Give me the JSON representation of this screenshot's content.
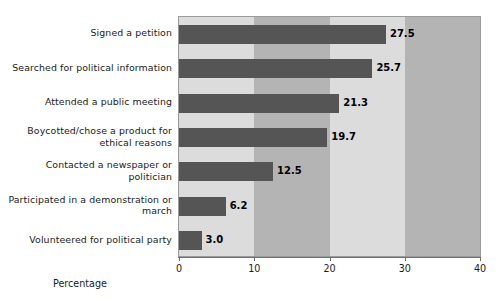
{
  "chart_data": {
    "type": "bar",
    "orientation": "horizontal",
    "title": "",
    "xlabel": "Percentage",
    "ylabel": "",
    "xlim": [
      0,
      40
    ],
    "xticks": [
      0,
      10,
      20,
      30,
      40
    ],
    "xtick_labels": [
      "0",
      "10",
      "20",
      "30",
      "40"
    ],
    "grid": false,
    "legend": null,
    "categories": [
      "Signed a petition",
      "Searched for political information",
      "Attended a public meeting",
      "Boycotted/chose a product for ethical reasons",
      "Contacted a newspaper or politician",
      "Participated in a demonstration or march",
      "Volunteered for political party"
    ],
    "values": [
      27.5,
      25.7,
      21.3,
      19.7,
      12.5,
      6.2,
      3.0
    ],
    "value_labels": [
      "27.5",
      "25.7",
      "21.3",
      "19.7",
      "12.5",
      "6.2",
      "3.0"
    ],
    "colors": {
      "bar": "#555555",
      "band_light": "#dcdcdc",
      "band_dark": "#b4b4b4",
      "axis": "#6f6f6f",
      "text": "#1b1b1b"
    },
    "background_bands": [
      {
        "from": 0,
        "to": 10,
        "shade": "light"
      },
      {
        "from": 10,
        "to": 20,
        "shade": "dark"
      },
      {
        "from": 20,
        "to": 30,
        "shade": "light"
      },
      {
        "from": 30,
        "to": 40,
        "shade": "dark"
      }
    ]
  }
}
